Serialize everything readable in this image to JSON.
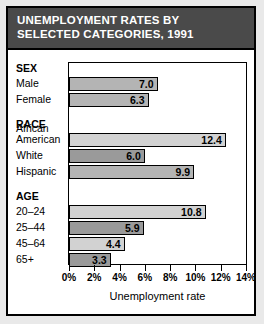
{
  "title": {
    "line1": "UNEMPLOYMENT RATES BY",
    "line2": "SELECTED CATEGORIES, 1991"
  },
  "colors": {
    "title_bar": "#4a4a4a",
    "title_text": "#ffffff",
    "bar_light": "#d2d2d2",
    "bar_medium": "#b4b4b4",
    "bar_dark": "#9a9a9a",
    "frame": "#000000",
    "page_background": "#e9e9e9"
  },
  "chart_data": {
    "type": "bar",
    "orientation": "horizontal",
    "title": "UNEMPLOYMENT RATES BY SELECTED CATEGORIES, 1991",
    "xlabel": "Unemployment rate",
    "ylabel": "",
    "xlim": [
      0,
      14
    ],
    "xticks": [
      0,
      2,
      4,
      6,
      8,
      10,
      12,
      14
    ],
    "xtick_labels": [
      "0%",
      "2%",
      "4%",
      "6%",
      "8%",
      "10%",
      "12%",
      "14%"
    ],
    "grid": false,
    "legend": "none",
    "groups": [
      {
        "name": "SEX",
        "items": [
          {
            "label": "Male",
            "value": 7.0,
            "value_label": "7.0",
            "shade": "medium"
          },
          {
            "label": "Female",
            "value": 6.3,
            "value_label": "6.3",
            "shade": "medium"
          }
        ]
      },
      {
        "name": "RACE",
        "items": [
          {
            "label": "African American",
            "label_line1": "African",
            "label_line2": "American",
            "value": 12.4,
            "value_label": "12.4",
            "shade": "light"
          },
          {
            "label": "White",
            "value": 6.0,
            "value_label": "6.0",
            "shade": "dark"
          },
          {
            "label": "Hispanic",
            "value": 9.9,
            "value_label": "9.9",
            "shade": "medium"
          }
        ]
      },
      {
        "name": "AGE",
        "items": [
          {
            "label": "20–24",
            "value": 10.8,
            "value_label": "10.8",
            "shade": "light"
          },
          {
            "label": "25–44",
            "value": 5.9,
            "value_label": "5.9",
            "shade": "dark"
          },
          {
            "label": "45–64",
            "value": 4.4,
            "value_label": "4.4",
            "shade": "light"
          },
          {
            "label": "65+",
            "value": 3.3,
            "value_label": "3.3",
            "shade": "dark"
          }
        ]
      }
    ],
    "categories": [
      "Male",
      "Female",
      "African American",
      "White",
      "Hispanic",
      "20–24",
      "25–44",
      "45–64",
      "65+"
    ],
    "values": [
      7.0,
      6.3,
      12.4,
      6.0,
      9.9,
      10.8,
      5.9,
      4.4,
      3.3
    ]
  }
}
